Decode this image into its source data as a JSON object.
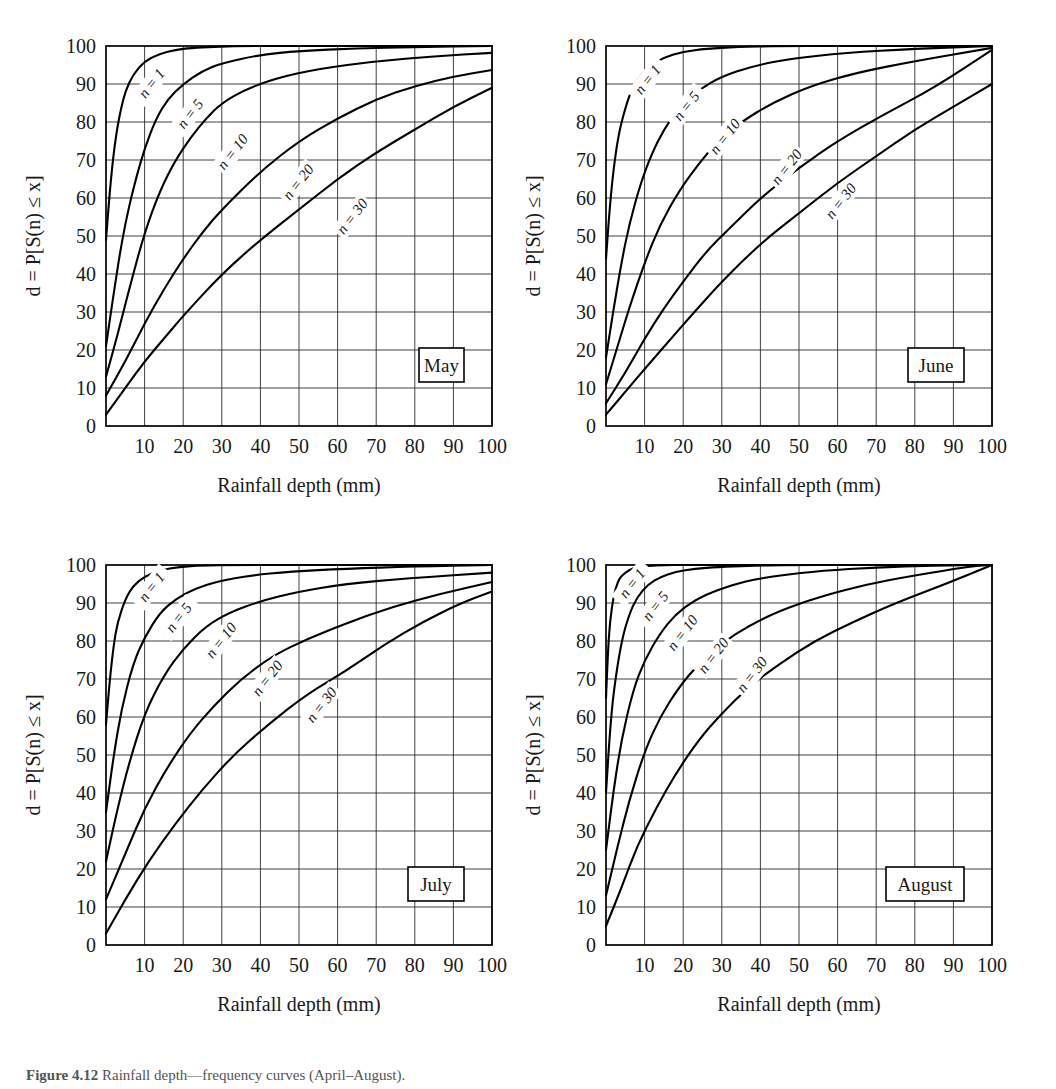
{
  "figure": {
    "caption_prefix": "Figure 4.12",
    "caption_text": "Rainfall depth—frequency curves (April–August)."
  },
  "chart_data": [
    {
      "type": "line",
      "title": "May",
      "xlabel": "Rainfall depth (mm)",
      "ylabel": "d = P[S(n) ≤ x]",
      "xlim": [
        0,
        100
      ],
      "ylim": [
        0,
        100
      ],
      "xticks": [
        10,
        20,
        30,
        40,
        50,
        60,
        70,
        80,
        90,
        100
      ],
      "yticks": [
        0,
        10,
        20,
        30,
        40,
        50,
        60,
        70,
        80,
        90,
        100
      ],
      "grid": true,
      "legend_position": "inline-curve-labels",
      "series": [
        {
          "name": "n = 1",
          "x": [
            0,
            1,
            2,
            3,
            4,
            5,
            7,
            10,
            14,
            18,
            22,
            28,
            35,
            45,
            60,
            80,
            100
          ],
          "y": [
            49,
            62,
            72,
            79,
            84,
            88,
            92.5,
            96,
            98,
            99,
            99.5,
            99.8,
            100,
            100,
            100,
            100,
            100
          ]
        },
        {
          "name": "n = 5",
          "x": [
            0,
            2,
            4,
            6,
            8,
            10,
            13,
            16,
            20,
            25,
            30,
            40,
            50,
            65,
            80,
            100
          ],
          "y": [
            21,
            35,
            48,
            58,
            66,
            73,
            81,
            86,
            90,
            93.5,
            95.5,
            97.7,
            98.7,
            99.4,
            99.7,
            100
          ]
        },
        {
          "name": "n = 10",
          "x": [
            0,
            3,
            6,
            10,
            14,
            18,
            22,
            26,
            30,
            36,
            44,
            55,
            70,
            85,
            100
          ],
          "y": [
            13,
            24,
            36,
            51,
            62,
            70,
            76,
            81,
            85,
            88.5,
            91.5,
            94,
            96,
            97.3,
            98.2
          ]
        },
        {
          "name": "n = 20",
          "x": [
            0,
            5,
            10,
            15,
            20,
            25,
            30,
            40,
            50,
            60,
            70,
            80,
            90,
            100
          ],
          "y": [
            8,
            17,
            27,
            36,
            44,
            51,
            57,
            67,
            75,
            81,
            86,
            89.5,
            92,
            93.7
          ]
        },
        {
          "name": "n = 30",
          "x": [
            0,
            5,
            10,
            15,
            20,
            30,
            40,
            50,
            60,
            70,
            80,
            90,
            100
          ],
          "y": [
            3,
            10,
            17,
            23,
            29,
            40,
            49,
            57,
            65,
            72,
            78,
            84,
            89
          ]
        }
      ],
      "series_label_anchor": [
        {
          "name": "n = 1",
          "x": 12,
          "y": 90
        },
        {
          "name": "n = 5",
          "x": 22,
          "y": 82
        },
        {
          "name": "n = 10",
          "x": 33,
          "y": 72
        },
        {
          "name": "n = 20",
          "x": 50,
          "y": 64
        },
        {
          "name": "n = 30",
          "x": 64,
          "y": 55
        }
      ]
    },
    {
      "type": "line",
      "title": "June",
      "xlabel": "Rainfall depth (mm)",
      "ylabel": "d = P[S(n) ≤ x]",
      "xlim": [
        0,
        100
      ],
      "ylim": [
        0,
        100
      ],
      "xticks": [
        10,
        20,
        30,
        40,
        50,
        60,
        70,
        80,
        90,
        100
      ],
      "yticks": [
        0,
        10,
        20,
        30,
        40,
        50,
        60,
        70,
        80,
        90,
        100
      ],
      "grid": true,
      "legend_position": "inline-curve-labels",
      "series": [
        {
          "name": "n = 1",
          "x": [
            0,
            1,
            2,
            3,
            4,
            6,
            8,
            11,
            15,
            20,
            26,
            34,
            45,
            60,
            80,
            100
          ],
          "y": [
            44,
            58,
            68,
            75,
            80,
            87,
            91,
            94.5,
            97,
            98.5,
            99.3,
            99.7,
            100,
            100,
            100,
            100
          ]
        },
        {
          "name": "n = 5",
          "x": [
            0,
            2,
            4,
            6,
            9,
            12,
            15,
            19,
            24,
            30,
            38,
            48,
            62,
            80,
            100
          ],
          "y": [
            18,
            31,
            43,
            53,
            64,
            72,
            78,
            84,
            88.5,
            92,
            94.7,
            96.7,
            98.2,
            99.3,
            100
          ]
        },
        {
          "name": "n = 10",
          "x": [
            0,
            3,
            6,
            10,
            14,
            19,
            24,
            29,
            35,
            43,
            53,
            65,
            80,
            100
          ],
          "y": [
            11,
            21,
            31,
            43,
            53,
            62,
            69,
            75,
            80,
            85,
            89.5,
            93,
            96,
            99.5
          ]
        },
        {
          "name": "n = 20",
          "x": [
            0,
            5,
            10,
            15,
            20,
            26,
            32,
            40,
            50,
            60,
            72,
            85,
            100
          ],
          "y": [
            6,
            14,
            23,
            31,
            38,
            46,
            52,
            60,
            68,
            75,
            82,
            89,
            99
          ]
        },
        {
          "name": "n = 30",
          "x": [
            0,
            5,
            10,
            16,
            22,
            30,
            40,
            50,
            60,
            70,
            80,
            90,
            100
          ],
          "y": [
            3,
            9,
            15,
            22,
            29,
            38,
            48,
            56,
            64,
            71,
            78,
            84,
            90
          ]
        }
      ],
      "series_label_anchor": [
        {
          "name": "n = 1",
          "x": 11,
          "y": 91
        },
        {
          "name": "n = 5",
          "x": 21,
          "y": 84
        },
        {
          "name": "n = 10",
          "x": 31,
          "y": 76
        },
        {
          "name": "n = 20",
          "x": 47,
          "y": 68
        },
        {
          "name": "n = 30",
          "x": 61,
          "y": 59
        }
      ]
    },
    {
      "type": "line",
      "title": "July",
      "xlabel": "Rainfall depth (mm)",
      "ylabel": "d = P[S(n) ≤ x]",
      "xlim": [
        0,
        100
      ],
      "ylim": [
        0,
        100
      ],
      "xticks": [
        10,
        20,
        30,
        40,
        50,
        60,
        70,
        80,
        90,
        100
      ],
      "yticks": [
        0,
        10,
        20,
        30,
        40,
        50,
        60,
        70,
        80,
        90,
        100
      ],
      "grid": true,
      "legend_position": "inline-curve-labels",
      "series": [
        {
          "name": "n = 1",
          "x": [
            0,
            1,
            2,
            3,
            5,
            7,
            10,
            14,
            19,
            25,
            33,
            45,
            60,
            80,
            100
          ],
          "y": [
            58,
            70,
            79,
            85,
            91,
            94.5,
            97,
            98.7,
            99.5,
            99.9,
            100,
            100,
            100,
            100,
            100
          ]
        },
        {
          "name": "n = 5",
          "x": [
            0,
            2,
            4,
            7,
            10,
            14,
            18,
            23,
            29,
            37,
            48,
            62,
            80,
            100
          ],
          "y": [
            35,
            50,
            62,
            74,
            81,
            87.5,
            91,
            93.8,
            95.7,
            97.2,
            98.3,
            99,
            99.6,
            100
          ]
        },
        {
          "name": "n = 10",
          "x": [
            0,
            3,
            6,
            10,
            15,
            20,
            26,
            32,
            40,
            50,
            62,
            78,
            100
          ],
          "y": [
            22,
            36,
            48,
            61,
            71,
            78,
            84,
            87.5,
            90.5,
            93,
            95,
            96.5,
            98
          ]
        },
        {
          "name": "n = 20",
          "x": [
            0,
            5,
            10,
            16,
            22,
            28,
            35,
            43,
            52,
            62,
            74,
            87,
            100
          ],
          "y": [
            12,
            24,
            36,
            47,
            56,
            63,
            70,
            76,
            80.5,
            84.5,
            89,
            92.5,
            95.5
          ]
        },
        {
          "name": "n = 30",
          "x": [
            0,
            5,
            11,
            18,
            25,
            33,
            42,
            52,
            62,
            72,
            82,
            92,
            100
          ],
          "y": [
            3,
            12,
            22,
            32,
            41,
            50,
            58,
            66,
            72,
            79,
            85,
            90,
            93
          ]
        }
      ],
      "series_label_anchor": [
        {
          "name": "n = 1",
          "x": 12,
          "y": 94
        },
        {
          "name": "n = 5",
          "x": 19,
          "y": 86
        },
        {
          "name": "n = 10",
          "x": 30,
          "y": 80
        },
        {
          "name": "n = 20",
          "x": 42,
          "y": 70
        },
        {
          "name": "n = 30",
          "x": 56,
          "y": 63
        }
      ]
    },
    {
      "type": "line",
      "title": "August",
      "xlabel": "Rainfall depth (mm)",
      "ylabel": "d = P[S(n) ≤ x]",
      "xlim": [
        0,
        100
      ],
      "ylim": [
        0,
        100
      ],
      "xticks": [
        10,
        20,
        30,
        40,
        50,
        60,
        70,
        80,
        90,
        100
      ],
      "yticks": [
        0,
        10,
        20,
        30,
        40,
        50,
        60,
        70,
        80,
        90,
        100
      ],
      "grid": true,
      "legend_position": "inline-curve-labels",
      "series": [
        {
          "name": "n = 1",
          "x": [
            0,
            0.5,
            1,
            2,
            3,
            4,
            6,
            8,
            11,
            15,
            20,
            27,
            36,
            50,
            70,
            100
          ],
          "y": [
            65,
            77,
            85,
            92,
            95.5,
            97.2,
            98.7,
            99.4,
            99.8,
            100,
            100,
            100,
            100,
            100,
            100,
            100
          ]
        },
        {
          "name": "n = 5",
          "x": [
            0,
            1,
            2,
            4,
            6,
            8,
            11,
            14,
            18,
            23,
            29,
            37,
            48,
            62,
            80,
            100
          ],
          "y": [
            40,
            56,
            67,
            80,
            87,
            91.5,
            95,
            96.8,
            98.2,
            99,
            99.5,
            99.8,
            100,
            100,
            100,
            100
          ]
        },
        {
          "name": "n = 10",
          "x": [
            0,
            2,
            4,
            7,
            10,
            14,
            18,
            23,
            29,
            36,
            45,
            56,
            70,
            85,
            100
          ],
          "y": [
            25,
            41,
            54,
            67,
            75,
            82,
            87,
            90.8,
            93.5,
            95.7,
            97.3,
            98.5,
            99.4,
            99.9,
            100
          ]
        },
        {
          "name": "n = 20",
          "x": [
            0,
            3,
            6,
            10,
            14,
            19,
            24,
            30,
            37,
            45,
            55,
            67,
            80,
            95,
            100
          ],
          "y": [
            13,
            26,
            38,
            51,
            60,
            68,
            74,
            79.5,
            84,
            88,
            91.5,
            94.8,
            97.3,
            99.7,
            100
          ]
        },
        {
          "name": "n = 30",
          "x": [
            0,
            4,
            8,
            13,
            18,
            24,
            30,
            37,
            45,
            54,
            64,
            75,
            88,
            100
          ],
          "y": [
            5,
            15,
            26,
            36,
            45,
            54,
            61,
            68,
            74,
            80,
            85,
            90,
            95,
            100
          ]
        }
      ],
      "series_label_anchor": [
        {
          "name": "n = 1",
          "x": 7,
          "y": 95
        },
        {
          "name": "n = 5",
          "x": 13,
          "y": 89
        },
        {
          "name": "n = 10",
          "x": 20,
          "y": 82
        },
        {
          "name": "n = 20",
          "x": 28,
          "y": 76
        },
        {
          "name": "n = 30",
          "x": 38,
          "y": 71
        }
      ]
    }
  ]
}
